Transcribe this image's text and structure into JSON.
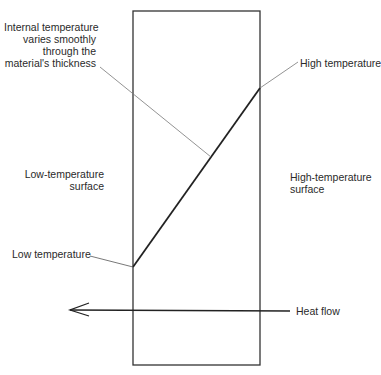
{
  "diagram": {
    "colors": {
      "outline": "#333333",
      "gradient_line": "#222222",
      "leader": "#777777",
      "text": "#2a2a2a"
    },
    "slab": {
      "x": 133,
      "y": 11,
      "width": 127,
      "height": 354
    },
    "temperature_profile": {
      "low_point": {
        "x": 133,
        "y": 267
      },
      "high_point": {
        "x": 260,
        "y": 88
      }
    },
    "labels": {
      "internal": {
        "line1": "Internal temperature",
        "line2": "varies smoothly",
        "line3": "through the",
        "line4": "material's thickness"
      },
      "high_temperature": "High temperature",
      "low_surface": {
        "line1": "Low-temperature",
        "line2": "surface"
      },
      "high_surface": {
        "line1": "High-temperature",
        "line2": "surface"
      },
      "low_temperature": "Low temperature",
      "heat_flow": "Heat flow"
    },
    "arrow": {
      "direction": "left",
      "from_x": 290,
      "to_x": 70,
      "y": 311
    }
  }
}
